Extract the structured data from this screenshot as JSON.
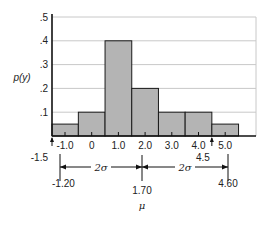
{
  "chart_data": {
    "type": "bar",
    "title": "",
    "xlabel": "",
    "ylabel": "p(y)",
    "ylim": [
      0,
      0.5
    ],
    "yticks": [
      ".1",
      ".2",
      ".3",
      ".4",
      ".5"
    ],
    "grid": true,
    "categories": [
      "-1.0",
      "0",
      "1.0",
      "2.0",
      "3.0",
      "4.0",
      "5.0"
    ],
    "x_centers": [
      -1.0,
      0,
      1.0,
      2.0,
      3.0,
      4.0,
      5.0
    ],
    "values": [
      0.05,
      0.1,
      0.4,
      0.2,
      0.1,
      0.1,
      0.05
    ],
    "annotations": {
      "mean_label": "1.70",
      "mean_symbol": "μ",
      "left_bound": "-1.20",
      "right_bound": "4.60",
      "left_mark": "-1.5",
      "right_mark": "4.5",
      "interval_label_left": "2σ",
      "interval_label_right": "2σ"
    }
  },
  "colors": {
    "bar_fill": "#b4b4b4",
    "bar_stroke": "#1a1a1a",
    "grid": "#c8c8c8",
    "axis": "#111111"
  }
}
